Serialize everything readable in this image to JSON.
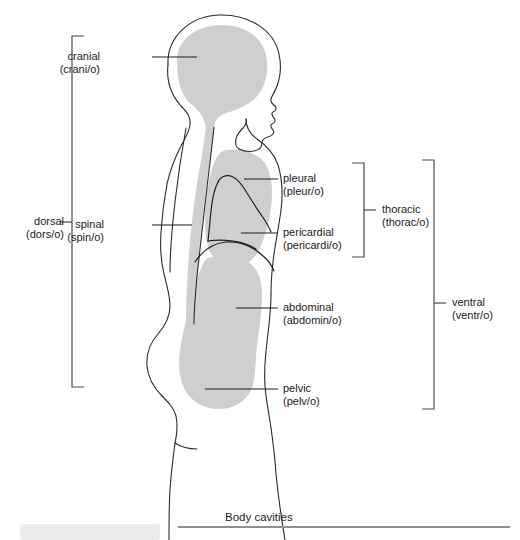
{
  "figure": {
    "caption": "Body cavities",
    "colors": {
      "cavity_fill": "#cfcfcf",
      "outline": "#2b2b2b",
      "leader": "#1a1a1a",
      "bracket": "#4a4a4a",
      "caption_rule": "#8f8f8f",
      "footer_block": "#ebebeb",
      "background": "#ffffff"
    },
    "labels": [
      {
        "id": "cranial",
        "term": "cranial",
        "root": "(crani/o)",
        "text_x": 100,
        "text_y": 50,
        "align": "leftal",
        "leader": {
          "x1": 152,
          "y1": 57,
          "x2": 197,
          "y2": 57
        }
      },
      {
        "id": "spinal",
        "term": "spinal",
        "root": "(spin/o)",
        "text_x": 104,
        "text_y": 218,
        "align": "leftal",
        "leader": {
          "x1": 152,
          "y1": 225,
          "x2": 192,
          "y2": 225
        }
      },
      {
        "id": "pleural",
        "term": "pleural",
        "root": "(pleur/o)",
        "text_x": 283,
        "text_y": 172,
        "align": "right",
        "leader": {
          "x1": 244,
          "y1": 179,
          "x2": 278,
          "y2": 179
        }
      },
      {
        "id": "pericardial",
        "term": "pericardial",
        "root": "(pericardi/o)",
        "text_x": 283,
        "text_y": 226,
        "align": "right",
        "leader": {
          "x1": 241,
          "y1": 233,
          "x2": 278,
          "y2": 233
        }
      },
      {
        "id": "abdominal",
        "term": "abdominal",
        "root": "(abdomin/o)",
        "text_x": 283,
        "text_y": 301,
        "align": "right",
        "leader": {
          "x1": 236,
          "y1": 308,
          "x2": 278,
          "y2": 308
        }
      },
      {
        "id": "pelvic",
        "term": "pelvic",
        "root": "(pelv/o)",
        "text_x": 283,
        "text_y": 382,
        "align": "right",
        "leader": {
          "x1": 205,
          "y1": 389,
          "x2": 278,
          "y2": 389
        }
      }
    ],
    "brackets": [
      {
        "id": "dorsal",
        "term": "dorsal",
        "root": "(dors/o)",
        "side": "left",
        "x": 72,
        "y_top": 36,
        "y_bottom": 387,
        "tick_y": 222,
        "arm": 12,
        "text_x": 64,
        "text_y": 215,
        "align": "leftal"
      },
      {
        "id": "thoracic",
        "term": "thoracic",
        "root": "(thorac/o)",
        "side": "right",
        "x": 364,
        "y_top": 163,
        "y_bottom": 257,
        "tick_y": 210,
        "arm": 12,
        "text_x": 382,
        "text_y": 203,
        "align": "right"
      },
      {
        "id": "ventral",
        "term": "ventral",
        "root": "(ventr/o)",
        "side": "right",
        "x": 434,
        "y_top": 160,
        "y_bottom": 409,
        "tick_y": 303,
        "arm": 12,
        "text_x": 452,
        "text_y": 296,
        "align": "right"
      }
    ],
    "caption_rule": {
      "x1": 178,
      "x2": 510,
      "y": 527
    },
    "footer_block": {
      "x": 20,
      "y": 524,
      "width": 140,
      "height": 16
    },
    "caption_pos": {
      "x": 225,
      "y": 511
    }
  }
}
